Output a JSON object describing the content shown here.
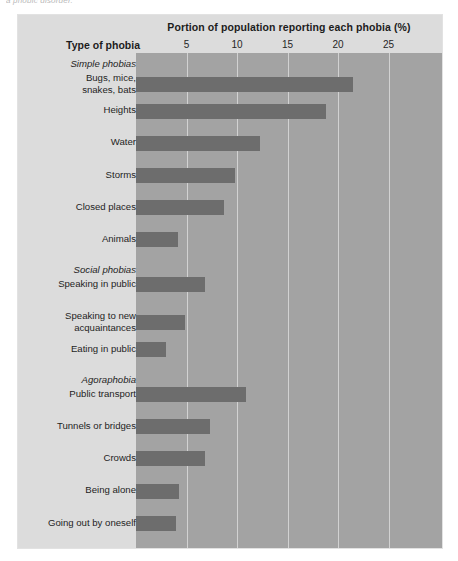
{
  "top_caption": "a phobic disorder.",
  "header": {
    "title": "Portion of population reporting each phobia (%)",
    "row_axis_caption": "Type of phobia"
  },
  "chart_data": {
    "type": "bar",
    "orientation": "horizontal",
    "title": "Portion of population reporting each phobia (%)",
    "xlabel": "Portion of population reporting each phobia (%)",
    "ylabel": "Type of phobia",
    "xlim": [
      0,
      30.3
    ],
    "xticks": [
      5,
      10,
      15,
      20,
      25
    ],
    "grid": true,
    "legend": "none",
    "bar_color": "#6d6d6d",
    "plot_background": "#a3a3a3",
    "panel_background": "#dcdcdc",
    "groups": [
      {
        "name": "Simple phobias",
        "items": [
          {
            "label": "Bugs, mice,\nsnakes, bats",
            "label_lines": [
              "Bugs, mice,",
              "snakes, bats"
            ],
            "value": 21.5
          },
          {
            "label": "Heights",
            "label_lines": [
              "Heights"
            ],
            "value": 18.8
          },
          {
            "label": "Water",
            "label_lines": [
              "Water"
            ],
            "value": 12.3
          },
          {
            "label": "Storms",
            "label_lines": [
              "Storms"
            ],
            "value": 9.8
          },
          {
            "label": "Closed places",
            "label_lines": [
              "Closed places"
            ],
            "value": 8.7
          },
          {
            "label": "Animals",
            "label_lines": [
              "Animals"
            ],
            "value": 4.2
          }
        ]
      },
      {
        "name": "Social phobias",
        "items": [
          {
            "label": "Speaking in public",
            "label_lines": [
              "Speaking in public"
            ],
            "value": 6.8
          },
          {
            "label": "Speaking to new\nacquaintances",
            "label_lines": [
              "Speaking to new",
              "acquaintances"
            ],
            "value": 4.8
          },
          {
            "label": "Eating in public",
            "label_lines": [
              "Eating in public"
            ],
            "value": 3.0
          }
        ]
      },
      {
        "name": "Agoraphobia",
        "items": [
          {
            "label": "Public transport",
            "label_lines": [
              "Public transport"
            ],
            "value": 10.9
          },
          {
            "label": "Tunnels or bridges",
            "label_lines": [
              "Tunnels or bridges"
            ],
            "value": 7.3
          },
          {
            "label": "Crowds",
            "label_lines": [
              "Crowds"
            ],
            "value": 6.8
          },
          {
            "label": "Being alone",
            "label_lines": [
              "Being alone"
            ],
            "value": 4.3
          },
          {
            "label": "Going out by oneself",
            "label_lines": [
              "Going out by oneself"
            ],
            "value": 4.0
          }
        ]
      }
    ],
    "categories": [
      "Bugs, mice, snakes, bats",
      "Heights",
      "Water",
      "Storms",
      "Closed places",
      "Animals",
      "Speaking in public",
      "Speaking to new acquaintances",
      "Eating in public",
      "Public transport",
      "Tunnels or bridges",
      "Crowds",
      "Being alone",
      "Going out by oneself"
    ],
    "values": [
      21.5,
      18.8,
      12.3,
      9.8,
      8.7,
      4.2,
      6.8,
      4.8,
      3.0,
      10.9,
      7.3,
      6.8,
      4.3,
      4.0
    ]
  }
}
